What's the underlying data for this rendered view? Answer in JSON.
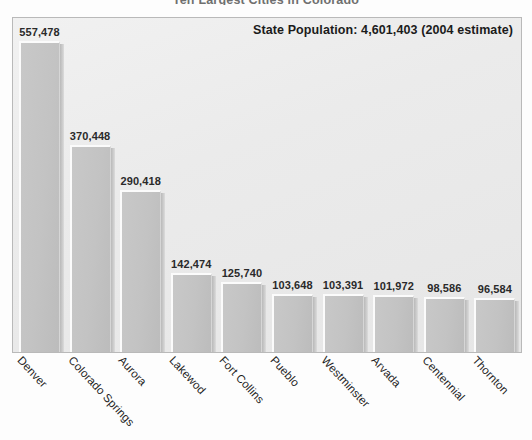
{
  "chart": {
    "title": "Ten Largest Cities in Colorado",
    "annotation": "State Population: 4,601,403 (2004 estimate)"
  },
  "chart_data": {
    "type": "bar",
    "title": "Ten Largest Cities in Colorado",
    "xlabel": "",
    "ylabel": "",
    "ylim": [
      0,
      557478
    ],
    "grid": false,
    "legend": null,
    "annotations": [
      "State Population: 4,601,403 (2004 estimate)"
    ],
    "categories": [
      "Denver",
      "Colorado Springs",
      "Aurora",
      "Lakewod",
      "Fort Collins",
      "Pueblo",
      "Westminster",
      "Arvada",
      "Centennial",
      "Thornton"
    ],
    "values": [
      557478,
      370448,
      290418,
      142474,
      125740,
      103648,
      103391,
      101972,
      98586,
      96584
    ],
    "value_labels": [
      "557,478",
      "370,448",
      "290,418",
      "142,474",
      "125,740",
      "103,648",
      "103,391",
      "101,972",
      "98,586",
      "96,584"
    ],
    "colors": {
      "bar": "#c4c4c4",
      "bar_highlight": "#fbfbfb",
      "bar_shadow": "#b2b2b2",
      "plot_background": "#ececec",
      "plot_border": "#b9b9b9",
      "text": "#1f1f1f"
    }
  }
}
